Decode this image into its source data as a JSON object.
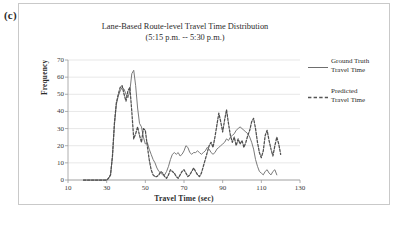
{
  "panel": {
    "label": "(c)"
  },
  "chart_title": {
    "line1": "Lane-Based Route-level Travel Time Distribution",
    "line2": "(5:15 p.m. -- 5:30 p.m.)"
  },
  "axes": {
    "x_label": "Travel Time (sec)",
    "y_label": "Frequency",
    "x_ticks": [
      "10",
      "30",
      "50",
      "70",
      "90",
      "110",
      "130"
    ],
    "y_ticks": [
      "0",
      "10",
      "20",
      "30",
      "40",
      "50",
      "60",
      "70"
    ]
  },
  "legend": {
    "position": "right",
    "entries": [
      {
        "label_line1": "Ground Truth",
        "label_line2": "Travel Time",
        "style": "solid",
        "color": "#6e6e6e"
      },
      {
        "label_line1": "Predicted",
        "label_line2": "Travel Time",
        "style": "dashed",
        "color": "#555555"
      }
    ]
  },
  "caption": {
    "text": ""
  },
  "colors": {
    "ground_truth": "#7a7a7a",
    "predicted": "#4f4f4f",
    "grid": "#d6d6d6",
    "axis": "#9a9a9a",
    "frame": "#c9c9c9"
  },
  "chart_data": {
    "type": "line",
    "title": "Lane-Based Route-level Travel Time Distribution (5:15 p.m. -- 5:30 p.m.)",
    "xlabel": "Travel Time (sec)",
    "ylabel": "Frequency",
    "xlim": [
      10,
      130
    ],
    "ylim": [
      0,
      70
    ],
    "x_tick_step": 20,
    "y_tick_step": 10,
    "grid": "horizontal",
    "legend_position": "right",
    "series": [
      {
        "name": "Ground Truth Travel Time",
        "style": "solid",
        "color": "#7a7a7a",
        "x": [
          18,
          20,
          22,
          24,
          26,
          28,
          29,
          30,
          31,
          32,
          33,
          34,
          35,
          36,
          37,
          38,
          39,
          40,
          41,
          42,
          43,
          44,
          45,
          46,
          47,
          48,
          49,
          50,
          51,
          52,
          53,
          54,
          55,
          56,
          57,
          58,
          59,
          60,
          61,
          62,
          63,
          64,
          65,
          66,
          67,
          68,
          69,
          70,
          71,
          72,
          73,
          74,
          75,
          76,
          77,
          78,
          79,
          80,
          81,
          82,
          83,
          84,
          85,
          86,
          87,
          88,
          89,
          90,
          91,
          92,
          93,
          94,
          95,
          96,
          97,
          98,
          99,
          100,
          101,
          102,
          103,
          104,
          105,
          106,
          107,
          108,
          109,
          110,
          111,
          112,
          113,
          114,
          115,
          116,
          117,
          118
        ],
        "y": [
          0,
          0,
          0,
          0,
          0,
          0,
          0,
          0,
          1,
          3,
          14,
          32,
          44,
          49,
          52,
          54,
          53,
          50,
          48,
          52,
          62,
          64,
          55,
          42,
          33,
          31,
          25,
          21,
          22,
          18,
          15,
          12,
          10,
          7,
          5,
          4,
          3,
          3,
          5,
          8,
          12,
          15,
          16,
          15,
          16,
          14,
          15,
          17,
          20,
          19,
          16,
          15,
          16,
          16,
          17,
          16,
          15,
          16,
          17,
          19,
          18,
          16,
          15,
          16,
          18,
          19,
          20,
          21,
          22,
          24,
          23,
          25,
          26,
          27,
          29,
          30,
          31,
          30,
          29,
          28,
          27,
          25,
          22,
          18,
          12,
          8,
          5,
          4,
          3,
          5,
          6,
          4,
          3,
          5,
          6,
          3
        ]
      },
      {
        "name": "Predicted Travel Time",
        "style": "dashed",
        "color": "#4f4f4f",
        "x": [
          18,
          20,
          22,
          24,
          26,
          28,
          29,
          30,
          31,
          32,
          33,
          34,
          35,
          36,
          37,
          38,
          39,
          40,
          41,
          42,
          43,
          44,
          45,
          46,
          47,
          48,
          49,
          50,
          51,
          52,
          53,
          54,
          55,
          56,
          57,
          58,
          59,
          60,
          61,
          62,
          63,
          64,
          65,
          66,
          67,
          68,
          69,
          70,
          71,
          72,
          73,
          74,
          75,
          76,
          77,
          78,
          79,
          80,
          81,
          82,
          83,
          84,
          85,
          86,
          87,
          88,
          89,
          90,
          91,
          92,
          93,
          94,
          95,
          96,
          97,
          98,
          99,
          100,
          101,
          102,
          103,
          104,
          105,
          106,
          107,
          108,
          109,
          110,
          111,
          112,
          113,
          114,
          115,
          116,
          117,
          118,
          119,
          120
        ],
        "y": [
          0,
          0,
          0,
          0,
          0,
          0,
          0,
          0,
          1,
          3,
          14,
          33,
          45,
          50,
          54,
          55,
          50,
          46,
          52,
          54,
          40,
          24,
          27,
          31,
          26,
          22,
          30,
          29,
          20,
          12,
          6,
          3,
          2,
          2,
          3,
          5,
          4,
          2,
          1,
          3,
          6,
          5,
          4,
          2,
          1,
          3,
          5,
          6,
          4,
          2,
          3,
          5,
          7,
          5,
          3,
          2,
          4,
          8,
          12,
          16,
          20,
          22,
          19,
          25,
          32,
          39,
          34,
          28,
          35,
          41,
          33,
          26,
          22,
          25,
          20,
          24,
          21,
          23,
          19,
          22,
          26,
          29,
          34,
          36,
          30,
          22,
          16,
          13,
          17,
          26,
          29,
          23,
          18,
          14,
          20,
          25,
          21,
          15
        ]
      }
    ]
  }
}
